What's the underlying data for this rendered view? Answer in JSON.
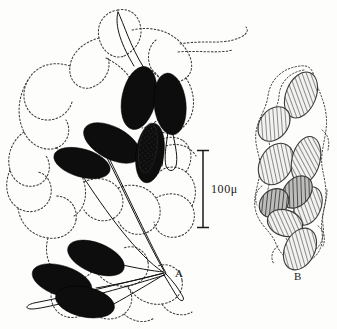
{
  "figure": {
    "background_color": "#fdfdfc",
    "ink_color": "#1a1a1a",
    "ovum_fill": "#0d0d0d",
    "hatch_color": "#5a5a5a",
    "stipple_color": "#4a4a4a",
    "panels": [
      {
        "id": "A",
        "label": "A",
        "label_x": 175,
        "label_y": 277,
        "description": "stalked dark ova among stippled tubules",
        "ova_count": 8,
        "ova": [
          {
            "cx": 139,
            "cy": 98,
            "rx": 17,
            "ry": 32,
            "angle": 12
          },
          {
            "cx": 170,
            "cy": 104,
            "rx": 16,
            "ry": 31,
            "angle": -6
          },
          {
            "cx": 112,
            "cy": 143,
            "rx": 31,
            "ry": 16,
            "angle": 28
          },
          {
            "cx": 150,
            "cy": 153,
            "rx": 14,
            "ry": 30,
            "angle": 8
          },
          {
            "cx": 82,
            "cy": 163,
            "rx": 29,
            "ry": 14,
            "angle": 16
          },
          {
            "cx": 96,
            "cy": 258,
            "rx": 30,
            "ry": 15,
            "angle": 22
          },
          {
            "cx": 62,
            "cy": 281,
            "rx": 31,
            "ry": 15,
            "angle": 18
          },
          {
            "cx": 85,
            "cy": 302,
            "rx": 30,
            "ry": 15,
            "angle": 12
          }
        ],
        "stalks": [
          {
            "x1": 139,
            "y1": 70,
            "x2": 118,
            "y2": 12
          },
          {
            "x1": 170,
            "y1": 74,
            "x2": 179,
            "y2": 141
          },
          {
            "x1": 152,
            "y1": 122,
            "x2": 160,
            "y2": 140
          },
          {
            "x1": 108,
            "y1": 152,
            "x2": 165,
            "y2": 272
          },
          {
            "x1": 82,
            "y1": 170,
            "x2": 160,
            "y2": 272
          },
          {
            "x1": 121,
            "y1": 262,
            "x2": 165,
            "y2": 272
          },
          {
            "x1": 92,
            "y1": 285,
            "x2": 165,
            "y2": 273
          },
          {
            "x1": 113,
            "y1": 303,
            "x2": 166,
            "y2": 274
          },
          {
            "x1": 165,
            "y1": 273,
            "x2": 181,
            "y2": 295
          },
          {
            "x1": 165,
            "y1": 273,
            "x2": 30,
            "y2": 305
          }
        ]
      },
      {
        "id": "B",
        "label": "B",
        "label_x": 294,
        "label_y": 280,
        "description": "cluster of hatched ellipses in stippled envelope",
        "ova_count": 9,
        "ova": [
          {
            "cx": 301,
            "cy": 95,
            "rx": 15,
            "ry": 24,
            "angle": 22
          },
          {
            "cx": 274,
            "cy": 124,
            "rx": 14,
            "ry": 19,
            "angle": 38
          },
          {
            "cx": 276,
            "cy": 164,
            "rx": 16,
            "ry": 22,
            "angle": 30
          },
          {
            "cx": 306,
            "cy": 160,
            "rx": 14,
            "ry": 24,
            "angle": 14
          },
          {
            "cx": 297,
            "cy": 192,
            "rx": 13,
            "ry": 18,
            "angle": 40
          },
          {
            "cx": 274,
            "cy": 203,
            "rx": 13,
            "ry": 16,
            "angle": 48
          },
          {
            "cx": 308,
            "cy": 206,
            "rx": 13,
            "ry": 20,
            "angle": 22
          },
          {
            "cx": 285,
            "cy": 223,
            "rx": 18,
            "ry": 13,
            "angle": 18
          },
          {
            "cx": 300,
            "cy": 249,
            "rx": 15,
            "ry": 22,
            "angle": 26
          }
        ]
      }
    ],
    "scale_bar": {
      "label": "100μ",
      "value": 100,
      "unit": "μ",
      "x": 203,
      "y_top": 150,
      "y_bottom": 228,
      "cap_half_width": 6,
      "label_x": 211,
      "label_y": 193
    }
  }
}
